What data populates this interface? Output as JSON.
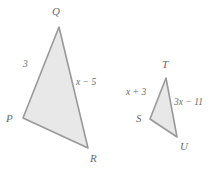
{
  "figure": {
    "background_color": "#ffffff",
    "fill_color": "#e8e8e8",
    "stroke_color": "#999999",
    "label_color": "#6b6b6b",
    "triangles": [
      {
        "name": "PQR",
        "vertices": [
          {
            "label": "Q",
            "x": 59,
            "y": 27,
            "label_x": 52,
            "label_y": 6
          },
          {
            "label": "P",
            "x": 23,
            "y": 118,
            "label_x": 6,
            "label_y": 113
          },
          {
            "label": "R",
            "x": 88,
            "y": 148,
            "label_x": 90,
            "label_y": 153
          }
        ],
        "sides": [
          {
            "name": "PQ",
            "label": "3",
            "label_x": 23,
            "label_y": 60
          },
          {
            "name": "QR",
            "label": "x − 5",
            "label_x": 76,
            "label_y": 78
          }
        ]
      },
      {
        "name": "STU",
        "vertices": [
          {
            "label": "T",
            "x": 166,
            "y": 78,
            "label_x": 162,
            "label_y": 59
          },
          {
            "label": "S",
            "x": 150,
            "y": 119,
            "label_x": 136,
            "label_y": 113
          },
          {
            "label": "U",
            "x": 177,
            "y": 137,
            "label_x": 180,
            "label_y": 141
          }
        ],
        "sides": [
          {
            "name": "ST",
            "label": "x + 3",
            "label_x": 126,
            "label_y": 88
          },
          {
            "name": "TU",
            "label": "3x − 11",
            "label_x": 174,
            "label_y": 98
          }
        ]
      }
    ]
  }
}
